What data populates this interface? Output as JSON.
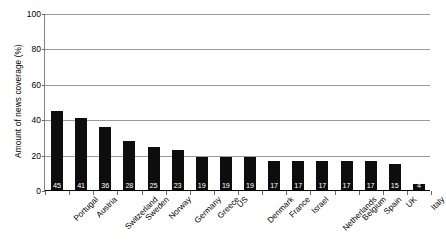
{
  "chart_data": {
    "type": "bar",
    "title": "",
    "xlabel": "",
    "ylabel": "Amount of news coverage (%)",
    "ylim": [
      0,
      100
    ],
    "yticks": [
      0,
      20,
      40,
      60,
      80,
      100
    ],
    "ytick_labels": [
      "0",
      "20",
      "40",
      "60",
      "80",
      "100"
    ],
    "grid": true,
    "legend": false,
    "bar_color": "#0d0d0d",
    "data_labels": true,
    "categories": [
      "Portugal",
      "Austria",
      "Switzerland",
      "Sweden",
      "Norway",
      "Germany",
      "Greece",
      "US",
      "Denmark",
      "France",
      "Israel",
      "Netherlands",
      "Belgium",
      "Spain",
      "UK",
      "Italy"
    ],
    "values": [
      45,
      41,
      36,
      28,
      25,
      23,
      19,
      19,
      19,
      17,
      17,
      17,
      17,
      17,
      15,
      4
    ],
    "value_labels": [
      "45",
      "41",
      "36",
      "28",
      "25",
      "23",
      "19",
      "19",
      "19",
      "17",
      "17",
      "17",
      "17",
      "17",
      "15",
      "4"
    ]
  }
}
